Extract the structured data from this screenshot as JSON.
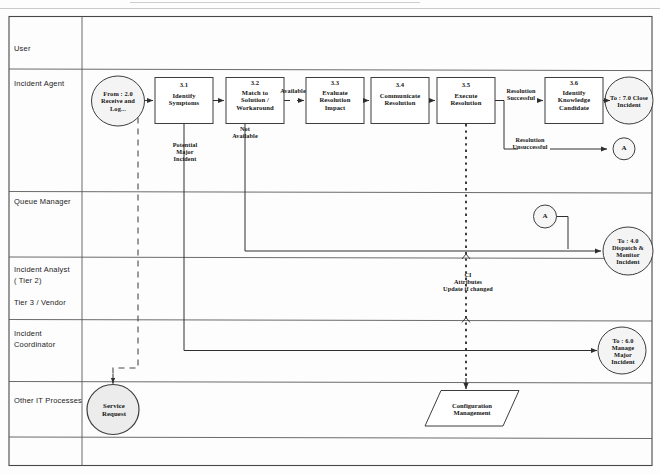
{
  "diagram": {
    "lanes": [
      {
        "id": "user",
        "label": "User"
      },
      {
        "id": "incident-agent",
        "label": "Incident Agent"
      },
      {
        "id": "queue-manager",
        "label": "Queue Manager"
      },
      {
        "id": "incident-analyst",
        "label": "Incident Analyst\n( Tier 2)\n\nTier 3 / Vendor"
      },
      {
        "id": "incident-coordinator",
        "label": "Incident\nCoordinator"
      },
      {
        "id": "other-it-processes",
        "label": "Other IT Processes"
      }
    ],
    "processes": [
      {
        "id": "p31",
        "number": "3.1",
        "label": "Identify\nSymptoms"
      },
      {
        "id": "p32",
        "number": "3.2",
        "label": "Match to\nSolution /\nWorkaround"
      },
      {
        "id": "p33",
        "number": "3.3",
        "label": "Evaluate\nResolution\nImpact"
      },
      {
        "id": "p34",
        "number": "3.4",
        "label": "Communicate\nResolution"
      },
      {
        "id": "p35",
        "number": "3.5",
        "label": "Execute\nResolution"
      },
      {
        "id": "p36",
        "number": "3.6",
        "label": "Identify\nKnowledge\nCandidate"
      }
    ],
    "terminators": [
      {
        "id": "start",
        "label": "From : 2.0\nReceive and\nLog..."
      },
      {
        "id": "close-incident",
        "label": "To : 7.0 Close\nIncident"
      },
      {
        "id": "dispatch-monitor",
        "label": "To : 4.0\nDispatch &\nMonitor\nIncident"
      },
      {
        "id": "manage-major",
        "label": "To : 6.0\nManage\nMajor\nIncident"
      },
      {
        "id": "service-request",
        "label": "Service\nRequest"
      }
    ],
    "connectors": [
      {
        "id": "connector-a-right",
        "label": "A"
      },
      {
        "id": "connector-a-queue",
        "label": "A"
      }
    ],
    "data_store": {
      "id": "configuration-management",
      "label": "Configuration\nManagement"
    },
    "flow_labels": [
      {
        "id": "available",
        "label": "Available"
      },
      {
        "id": "not-available",
        "label": "Not\nAvailable"
      },
      {
        "id": "potential-major-incident",
        "label": "Potential\nMajor\nIncident"
      },
      {
        "id": "resolution-successful",
        "label": "Resolution\nSuccessful"
      },
      {
        "id": "resolution-unsuccessful",
        "label": "Resolution\nUnsuccessful"
      },
      {
        "id": "ci-attributes",
        "label": "CI\nAttributes\nUpdate if changed"
      }
    ],
    "colors": {
      "line": "#3a3a3a",
      "text": "#151515",
      "background": "#fdfdfd",
      "terminator_fill": "#f3f3f3"
    }
  }
}
